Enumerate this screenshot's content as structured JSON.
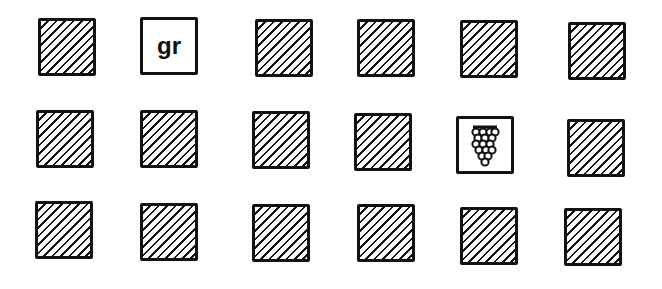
{
  "cards": [
    {
      "row": 1,
      "col": 1,
      "type": "hidden",
      "x": 38,
      "y": 18
    },
    {
      "row": 1,
      "col": 2,
      "type": "text",
      "label": "gr",
      "x": 140,
      "y": 17
    },
    {
      "row": 1,
      "col": 3,
      "type": "hidden",
      "x": 255,
      "y": 19
    },
    {
      "row": 1,
      "col": 4,
      "type": "hidden",
      "x": 357,
      "y": 19
    },
    {
      "row": 1,
      "col": 5,
      "type": "hidden",
      "x": 460,
      "y": 20
    },
    {
      "row": 1,
      "col": 6,
      "type": "hidden",
      "x": 568,
      "y": 22
    },
    {
      "row": 2,
      "col": 1,
      "type": "hidden",
      "x": 36,
      "y": 110
    },
    {
      "row": 2,
      "col": 2,
      "type": "hidden",
      "x": 140,
      "y": 110
    },
    {
      "row": 2,
      "col": 3,
      "type": "hidden",
      "x": 252,
      "y": 111
    },
    {
      "row": 2,
      "col": 4,
      "type": "hidden",
      "x": 354,
      "y": 113
    },
    {
      "row": 2,
      "col": 5,
      "type": "image",
      "icon": "grapes-icon",
      "x": 456,
      "y": 116
    },
    {
      "row": 2,
      "col": 6,
      "type": "hidden",
      "x": 567,
      "y": 119
    },
    {
      "row": 3,
      "col": 1,
      "type": "hidden",
      "x": 35,
      "y": 201
    },
    {
      "row": 3,
      "col": 2,
      "type": "hidden",
      "x": 140,
      "y": 203
    },
    {
      "row": 3,
      "col": 3,
      "type": "hidden",
      "x": 252,
      "y": 204
    },
    {
      "row": 3,
      "col": 4,
      "type": "hidden",
      "x": 357,
      "y": 204
    },
    {
      "row": 3,
      "col": 5,
      "type": "hidden",
      "x": 460,
      "y": 207
    },
    {
      "row": 3,
      "col": 6,
      "type": "hidden",
      "x": 564,
      "y": 208
    }
  ]
}
